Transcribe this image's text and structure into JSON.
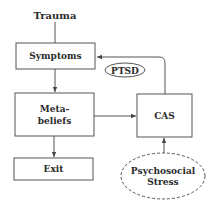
{
  "diagram": {
    "nodes": {
      "trauma": {
        "label": "Trauma"
      },
      "symptoms": {
        "label": "Symptoms"
      },
      "ptsd": {
        "label": "PTSD"
      },
      "metabeliefs": {
        "line1": "Meta-",
        "line2": "beliefs"
      },
      "cas": {
        "label": "CAS"
      },
      "exit": {
        "label": "Exit"
      },
      "stress": {
        "line1": "Psychosocial",
        "line2": "Stress"
      }
    },
    "edges": [
      {
        "from": "Trauma",
        "to": "Symptoms"
      },
      {
        "from": "Symptoms",
        "to": "Meta-beliefs"
      },
      {
        "from": "Meta-beliefs",
        "to": "CAS"
      },
      {
        "from": "Meta-beliefs",
        "to": "Exit"
      },
      {
        "from": "CAS",
        "to": "Symptoms",
        "label": "PTSD"
      },
      {
        "from": "Psychosocial Stress",
        "to": "CAS"
      }
    ]
  }
}
